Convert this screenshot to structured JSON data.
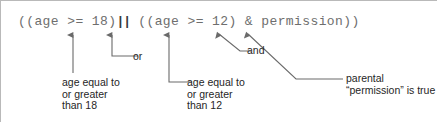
{
  "figure": {
    "background_color": "#ffffff",
    "border_color": "#b9b9b9",
    "code_color": "#6e6e6e",
    "label_color": "#262626",
    "leader_color": "#6a6a6a"
  },
  "code": {
    "prefix": "((age >= 18)",
    "operator": "||",
    "suffix": " ((age >= 12) & permission))",
    "full": "((age >= 18)|| ((age >= 12) & permission))"
  },
  "annotations": {
    "or": {
      "label": "or",
      "target": "||"
    },
    "and": {
      "label": "and",
      "target": "&"
    },
    "age18": {
      "label": "age equal to\nor greater\nthan 18",
      "target": ">= 18"
    },
    "age12": {
      "label": "age equal to\nor greater\nthan 12",
      "target": ">= 12"
    },
    "parental": {
      "label": "parental\n“permission” is true",
      "target": "permission"
    }
  }
}
